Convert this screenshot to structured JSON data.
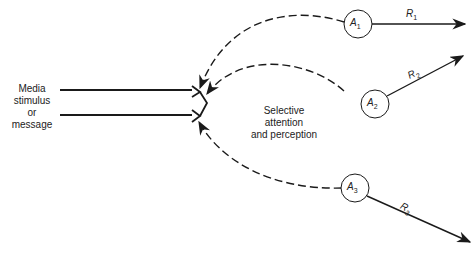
{
  "diagram": {
    "input_label": [
      "Media",
      "stimulus",
      "or",
      "message"
    ],
    "center_label": [
      "Selective",
      "attention",
      "and perception"
    ],
    "nodes": [
      {
        "name": "A",
        "sub": "1"
      },
      {
        "name": "A",
        "sub": "2"
      },
      {
        "name": "A",
        "sub": "3"
      }
    ],
    "responses": [
      {
        "name": "R",
        "sub": "1"
      },
      {
        "name": "R",
        "sub": "2"
      },
      {
        "name": "R",
        "sub": "3"
      }
    ],
    "colors": {
      "stroke": "#1a1a1a",
      "text": "#222222"
    }
  }
}
